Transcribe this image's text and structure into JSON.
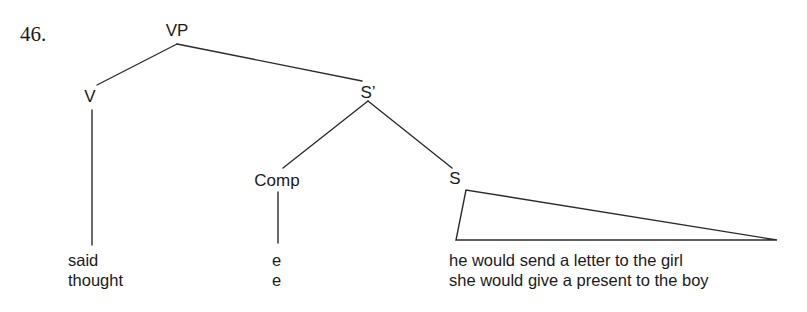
{
  "figure": {
    "item_number": "46.",
    "background_color": "#ffffff",
    "ink_color": "#2b2b2b"
  },
  "tree": {
    "nodes": [
      {
        "id": "vp",
        "label": "VP",
        "x": 177,
        "y": 32
      },
      {
        "id": "v",
        "label": "V",
        "x": 90,
        "y": 96
      },
      {
        "id": "sbar",
        "label": "S’",
        "x": 368,
        "y": 92
      },
      {
        "id": "comp",
        "label": "Comp",
        "x": 277,
        "y": 180
      },
      {
        "id": "s",
        "label": "S",
        "x": 455,
        "y": 180
      }
    ],
    "edges": [
      {
        "from": "vp",
        "to": "v",
        "x1": 177,
        "y1": 44,
        "x2": 97,
        "y2": 85
      },
      {
        "from": "vp",
        "to": "sbar",
        "x1": 177,
        "y1": 44,
        "x2": 362,
        "y2": 81
      },
      {
        "from": "sbar",
        "to": "comp",
        "x1": 368,
        "y1": 101,
        "x2": 283,
        "y2": 168
      },
      {
        "from": "sbar",
        "to": "s",
        "x1": 368,
        "y1": 101,
        "x2": 452,
        "y2": 168
      },
      {
        "from": "v",
        "to": "said",
        "x1": 92,
        "y1": 110,
        "x2": 92,
        "y2": 245
      },
      {
        "from": "comp",
        "to": "e",
        "x1": 278,
        "y1": 192,
        "x2": 278,
        "y2": 243
      }
    ],
    "triangle": {
      "apex_x": 466,
      "apex_y": 190,
      "left_x": 456,
      "left_y": 240,
      "right_x": 777,
      "right_y": 240
    }
  },
  "terminals": {
    "verb": {
      "x": 68,
      "y": 250,
      "lines": [
        "said",
        "thought"
      ]
    },
    "complementizer": {
      "x": 272,
      "y": 250,
      "lines": [
        "e",
        "e"
      ]
    },
    "sentence": {
      "x": 449,
      "y": 250,
      "lines": [
        "he would send a letter to the girl",
        "she would give a present to the boy"
      ]
    }
  }
}
